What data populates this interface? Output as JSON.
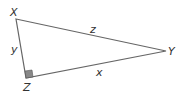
{
  "diagram": {
    "type": "right-triangle",
    "vertices": {
      "X": {
        "label": "X",
        "x": 16,
        "y": 19
      },
      "Y": {
        "label": "Y",
        "x": 166,
        "y": 51
      },
      "Z": {
        "label": "Z",
        "x": 26,
        "y": 78
      }
    },
    "sides": {
      "XY": {
        "label": "z"
      },
      "XZ": {
        "label": "y"
      },
      "ZY": {
        "label": "x"
      }
    },
    "right_angle_at": "Z",
    "colors": {
      "line": "#666666",
      "right_angle_fill": "#888888",
      "text": "#333333"
    }
  }
}
